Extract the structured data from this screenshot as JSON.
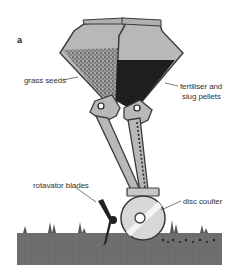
{
  "figure": {
    "panel_letter": "a",
    "labels": {
      "grass_seeds": "grass seeds",
      "fertiliser_line1": "fertiliser and",
      "fertiliser_line2": "slug pellets",
      "rotavator_blades": "rotavator blades",
      "disc_coulter": "disc coulter"
    },
    "colors": {
      "hopper_fill": "#b8b8b8",
      "outline": "#3a3a3a",
      "seeds": "#7a7a7a",
      "fertiliser": "#1e1e1e",
      "soil": "#6e6e6e",
      "disc": "#d8d8d8"
    }
  }
}
